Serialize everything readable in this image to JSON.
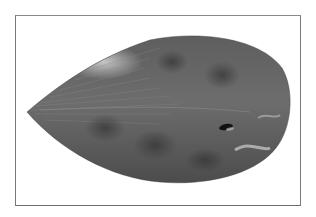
{
  "image": {
    "subject": "flatfish (sole) specimen, dorsal view",
    "style": "grayscale photograph",
    "background": "#ffffff",
    "frame_color": "#7a7a7a"
  },
  "colors": {
    "body_dark": "#4a4a4a",
    "body_mid": "#6b6b6b",
    "body_light": "#a8a8a8",
    "highlight": "#d9d9d9",
    "eye": "#111111"
  }
}
